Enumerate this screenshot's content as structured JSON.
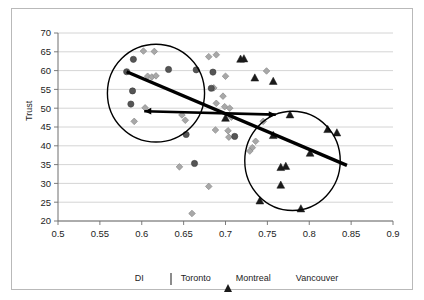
{
  "chart_data": {
    "type": "scatter",
    "title": "",
    "xlabel": "DI",
    "ylabel": "Trust",
    "xlim": [
      0.5,
      0.9
    ],
    "ylim": [
      20,
      70
    ],
    "xticks": [
      "0.5",
      "0.55",
      "0.6",
      "0.65",
      "0.7",
      "0.75",
      "0.8",
      "0.85",
      "0.9"
    ],
    "yticks": [
      "20",
      "25",
      "30",
      "35",
      "40",
      "45",
      "50",
      "55",
      "60",
      "65",
      "70"
    ],
    "grid": "horizontal",
    "legend_position": "bottom",
    "legend": [
      {
        "name": "Toronto",
        "marker": "diamond",
        "color": "#a8a8a8"
      },
      {
        "name": "Montreal",
        "marker": "triangle",
        "color": "#1a1a1a"
      },
      {
        "name": "Vancouver",
        "marker": "circle",
        "color": "#555555"
      }
    ],
    "series": [
      {
        "name": "Toronto",
        "marker": "diamond",
        "color": "#a8a8a8",
        "points": [
          [
            0.602,
            65.2
          ],
          [
            0.615,
            65.1
          ],
          [
            0.607,
            58.5
          ],
          [
            0.612,
            58.3
          ],
          [
            0.617,
            58.6
          ],
          [
            0.68,
            63.7
          ],
          [
            0.689,
            64.2
          ],
          [
            0.604,
            50.1
          ],
          [
            0.591,
            46.5
          ],
          [
            0.686,
            55.4
          ],
          [
            0.689,
            51.3
          ],
          [
            0.7,
            58.5
          ],
          [
            0.697,
            53.2
          ],
          [
            0.699,
            50.4
          ],
          [
            0.705,
            50.0
          ],
          [
            0.707,
            47.6
          ],
          [
            0.648,
            48.2
          ],
          [
            0.652,
            46.8
          ],
          [
            0.688,
            44.2
          ],
          [
            0.703,
            44.0
          ],
          [
            0.704,
            42.3
          ],
          [
            0.736,
            41.2
          ],
          [
            0.732,
            39.5
          ],
          [
            0.729,
            38.6
          ],
          [
            0.745,
            46.5
          ],
          [
            0.749,
            59.9
          ],
          [
            0.645,
            34.4
          ],
          [
            0.68,
            29.2
          ],
          [
            0.66,
            22.0
          ]
        ]
      },
      {
        "name": "Montreal",
        "marker": "triangle",
        "color": "#1a1a1a",
        "points": [
          [
            0.718,
            63.1
          ],
          [
            0.722,
            63.2
          ],
          [
            0.735,
            58.1
          ],
          [
            0.757,
            57.2
          ],
          [
            0.777,
            48.3
          ],
          [
            0.7,
            47.4
          ],
          [
            0.757,
            42.8
          ],
          [
            0.822,
            44.4
          ],
          [
            0.833,
            43.5
          ],
          [
            0.801,
            38.1
          ],
          [
            0.766,
            34.3
          ],
          [
            0.772,
            34.6
          ],
          [
            0.766,
            29.6
          ],
          [
            0.741,
            25.4
          ],
          [
            0.79,
            23.3
          ]
        ]
      },
      {
        "name": "Vancouver",
        "marker": "circle",
        "color": "#555555",
        "points": [
          [
            0.59,
            63.0
          ],
          [
            0.582,
            59.7
          ],
          [
            0.589,
            54.6
          ],
          [
            0.587,
            51.1
          ],
          [
            0.632,
            60.3
          ],
          [
            0.665,
            60.2
          ],
          [
            0.685,
            59.6
          ],
          [
            0.683,
            55.3
          ],
          [
            0.653,
            43.0
          ],
          [
            0.663,
            35.3
          ],
          [
            0.711,
            42.5
          ]
        ]
      }
    ],
    "annotations": {
      "clusters": [
        {
          "name": "left-cluster",
          "cx": 0.617,
          "cy": 54.0,
          "rx": 0.058,
          "ry": 13.0
        },
        {
          "name": "right-cluster",
          "cx": 0.78,
          "cy": 36.0,
          "rx": 0.057,
          "ry": 13.2
        }
      ],
      "trend_lines": [
        {
          "name": "regression-line",
          "x1": 0.582,
          "y1": 59.7,
          "x2": 0.845,
          "y2": 34.8
        },
        {
          "name": "horizontal-arrow",
          "x1": 0.603,
          "y1": 49.2,
          "x2": 0.76,
          "y2": 48.3,
          "arrow": "both"
        }
      ]
    }
  },
  "axes": {
    "y_title": "Trust",
    "x_title": "DI"
  }
}
